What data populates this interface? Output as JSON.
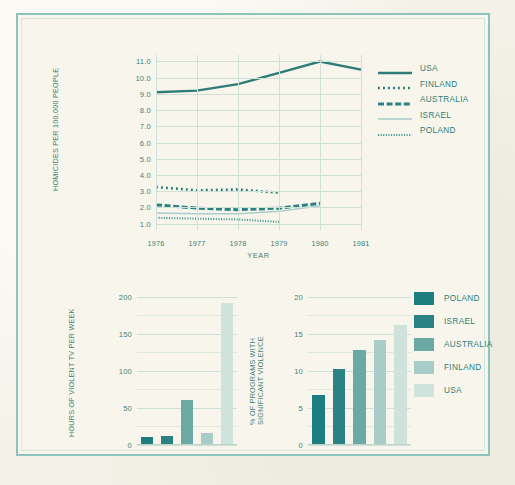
{
  "colors": {
    "frame": "#8cc3bd",
    "paper": "#f4f2e8",
    "panel": "#f8f6ec",
    "ink": "#2d7d76",
    "grid": "#cfe0d8",
    "series_poland": "#1d7e80",
    "series_israel": "#2a8284",
    "series_australia": "#6aa9a6",
    "series_finland": "#a8cdc8",
    "series_usa": "#cfe3dc"
  },
  "chart_data": [
    {
      "id": "homicide-line-chart",
      "type": "line",
      "title": "",
      "xlabel": "YEAR",
      "ylabel": "HOMICIDES PER 100,000 PEOPLE",
      "x": [
        "1976",
        "1977",
        "1978",
        "1979",
        "1980",
        "1981"
      ],
      "xlim": [
        1976,
        1981
      ],
      "ylim": [
        0.6,
        11.4
      ],
      "yticks": [
        "1.0",
        "2.0",
        "3.0",
        "4.0",
        "5.0",
        "6.0",
        "7.0",
        "8.0",
        "9.0",
        "10.0",
        "11.0"
      ],
      "grid": true,
      "legend_position": "right",
      "series": [
        {
          "name": "USA",
          "style": "solid",
          "color": "#2d7d76",
          "x": [
            "1976",
            "1977",
            "1978",
            "1979",
            "1980",
            "1981"
          ],
          "values": [
            9.1,
            9.2,
            9.6,
            10.3,
            11.0,
            10.5
          ]
        },
        {
          "name": "FINLAND",
          "style": "dotted-coarse",
          "color": "#2d7d76",
          "x": [
            "1976",
            "1977",
            "1978",
            "1979"
          ],
          "values": [
            3.25,
            3.05,
            3.1,
            2.9
          ]
        },
        {
          "name": "AUSTRALIA",
          "style": "dashed",
          "color": "#2a8284",
          "x": [
            "1976",
            "1977",
            "1978",
            "1979",
            "1980"
          ],
          "values": [
            2.15,
            1.95,
            1.85,
            1.95,
            2.25
          ]
        },
        {
          "name": "ISRAEL",
          "style": "solid-thin",
          "color": "#a8cdc8",
          "x": [
            "1976",
            "1977",
            "1978",
            "1979",
            "1980"
          ],
          "values": [
            1.65,
            1.6,
            1.6,
            1.75,
            2.1
          ]
        },
        {
          "name": "POLAND",
          "style": "dotted-fine",
          "color": "#3f9a92",
          "x": [
            "1976",
            "1977",
            "1978",
            "1979"
          ],
          "values": [
            1.35,
            1.3,
            1.25,
            1.1
          ]
        }
      ]
    },
    {
      "id": "violent-tv-bar-chart",
      "type": "bar",
      "title": "",
      "xlabel": "",
      "ylabel": "HOURS OF VIOLENT TV PER WEEK",
      "categories": [
        "POLAND",
        "ISRAEL",
        "AUSTRALIA",
        "FINLAND",
        "USA"
      ],
      "values": [
        11,
        12,
        61,
        16,
        192
      ],
      "ylim": [
        0,
        205
      ],
      "yticks": [
        "0",
        "50",
        "100",
        "150",
        "200"
      ],
      "grid": true,
      "bar_colors": [
        "#1d7e80",
        "#2a8284",
        "#6aa9a6",
        "#a8cdc8",
        "#cfe3dc"
      ]
    },
    {
      "id": "violent-programs-bar-chart",
      "type": "bar",
      "title": "",
      "xlabel": "",
      "ylabel": "% OF PROGRAMS WITH SIGNIFICANT VIOLENCE",
      "categories": [
        "POLAND",
        "ISRAEL",
        "AUSTRALIA",
        "FINLAND",
        "USA"
      ],
      "values": [
        6.8,
        10.3,
        12.8,
        14.2,
        16.2
      ],
      "ylim": [
        0,
        20.5
      ],
      "yticks": [
        "0",
        "5",
        "10",
        "15",
        "20"
      ],
      "grid": true,
      "legend_position": "right",
      "bar_colors": [
        "#1d7e80",
        "#2a8284",
        "#6aa9a6",
        "#a8cdc8",
        "#cfe3dc"
      ]
    }
  ],
  "line_chart": {
    "ylabel": "HOMICIDES PER 100,000 PEOPLE",
    "xlabel": "YEAR",
    "yticks": [
      "11.0",
      "10.0",
      "9.0",
      "8.0",
      "7.0",
      "6.0",
      "5.0",
      "4.0",
      "3.0",
      "2.0",
      "1.0"
    ],
    "xticks": [
      "1976",
      "1977",
      "1978",
      "1979",
      "1980",
      "1981"
    ],
    "legend": [
      {
        "label": "USA"
      },
      {
        "label": "FINLAND"
      },
      {
        "label": "AUSTRALIA"
      },
      {
        "label": "ISRAEL"
      },
      {
        "label": "POLAND"
      }
    ]
  },
  "bar_left": {
    "ylabel": "HOURS OF VIOLENT TV PER WEEK",
    "yticks": [
      "200",
      "150",
      "100",
      "50",
      "0"
    ]
  },
  "bar_right": {
    "ylabel_line1": "% OF PROGRAMS WITH",
    "ylabel_line2": "SIGNIFICANT VIOLENCE",
    "yticks": [
      "20",
      "15",
      "10",
      "5",
      "0"
    ],
    "legend": [
      {
        "label": "POLAND"
      },
      {
        "label": "ISRAEL"
      },
      {
        "label": "AUSTRALIA"
      },
      {
        "label": "FINLAND"
      },
      {
        "label": "USA"
      }
    ]
  }
}
